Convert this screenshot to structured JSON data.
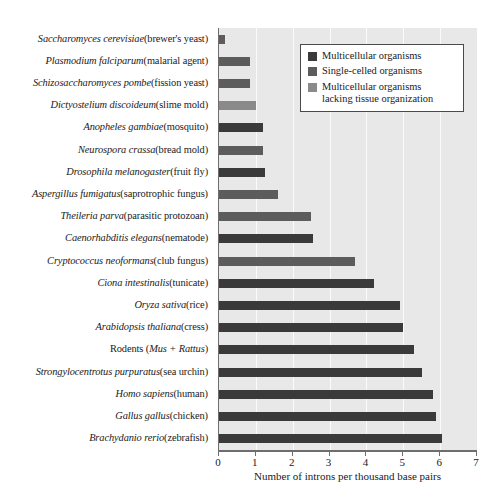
{
  "chart_data": {
    "type": "bar",
    "orientation": "horizontal",
    "title": "",
    "xlabel": "Number of introns per thousand base pairs",
    "ylabel": "",
    "xlim": [
      0,
      7
    ],
    "xticks": [
      0,
      1,
      2,
      3,
      4,
      5,
      6,
      7
    ],
    "xtick_labels": [
      "0",
      "1",
      "2",
      "3",
      "4",
      "5",
      "6",
      "7"
    ],
    "grid": true,
    "grid_axis": "x",
    "legend_position": "top-right",
    "categories": [
      "Saccharomyces cerevisiae (brewer's yeast)",
      "Plasmodium falciparum (malarial agent)",
      "Schizosaccharomyces pombe (fission yeast)",
      "Dictyostelium discoideum (slime mold)",
      "Anopheles gambiae (mosquito)",
      "Neurospora crassa (bread mold)",
      "Drosophila melanogaster (fruit fly)",
      "Aspergillus fumigatus (saprotrophic fungus)",
      "Theileria parva (parasitic protozoan)",
      "Caenorhabditis elegans (nematode)",
      "Cryptococcus neoformans (club fungus)",
      "Ciona intestinalis (tunicate)",
      "Oryza sativa (rice)",
      "Arabidopsis thaliana (cress)",
      "Rodents (Mus + Rattus)",
      "Strongylocentrotus purpuratus (sea urchin)",
      "Homo sapiens (human)",
      "Gallus gallus (chicken)",
      "Brachydanio rerio (zebrafish)"
    ],
    "values": [
      0.15,
      0.85,
      0.85,
      1.0,
      1.2,
      1.2,
      1.25,
      1.6,
      2.5,
      2.55,
      3.7,
      4.2,
      4.9,
      5.0,
      5.3,
      5.5,
      5.8,
      5.9,
      6.05
    ],
    "groups": [
      "single-celled",
      "single-celled",
      "single-celled",
      "lacking-tissue",
      "multicellular",
      "single-celled",
      "multicellular",
      "single-celled",
      "single-celled",
      "multicellular",
      "single-celled",
      "multicellular",
      "multicellular",
      "multicellular",
      "multicellular",
      "multicellular",
      "multicellular",
      "multicellular",
      "multicellular"
    ],
    "series": [
      {
        "name": "Multicellular organisms",
        "key": "multicellular",
        "color": "#3a3a3a"
      },
      {
        "name": "Single-celled organisms",
        "key": "single-celled",
        "color": "#5c5c5c"
      },
      {
        "name": "Multicellular organisms lacking tissue organization",
        "key": "lacking-tissue",
        "color": "#8a8a8a"
      }
    ]
  },
  "labels": [
    {
      "sci": "Saccharomyces cerevisiae",
      "com": " (brewer's yeast)"
    },
    {
      "sci": "Plasmodium falciparum",
      "com": " (malarial agent)"
    },
    {
      "sci": "Schizosaccharomyces pombe",
      "com": " (fission yeast)"
    },
    {
      "sci": "Dictyostelium discoideum",
      "com": " (slime mold)"
    },
    {
      "sci": "Anopheles gambiae",
      "com": " (mosquito)"
    },
    {
      "sci": "Neurospora crassa",
      "com": " (bread mold)"
    },
    {
      "sci": "Drosophila melanogaster",
      "com": " (fruit fly)"
    },
    {
      "sci": "Aspergillus fumigatus",
      "com": " (saprotrophic fungus)"
    },
    {
      "sci": "Theileria parva",
      "com": " (parasitic protozoan)"
    },
    {
      "sci": "Caenorhabditis elegans",
      "com": " (nematode)"
    },
    {
      "sci": "Cryptococcus neoformans",
      "com": " (club fungus)"
    },
    {
      "sci": "Ciona intestinalis",
      "com": " (tunicate)"
    },
    {
      "sci": "Oryza sativa",
      "com": " (rice)"
    },
    {
      "sci": "Arabidopsis thaliana",
      "com": " (cress)"
    },
    {
      "sci": "",
      "com": "Rodents (",
      "sci2": "Mus + Rattus",
      "com2": ")"
    },
    {
      "sci": "Strongylocentrotus purpuratus",
      "com": " (sea urchin)"
    },
    {
      "sci": "Homo sapiens",
      "com": " (human)"
    },
    {
      "sci": "Gallus gallus",
      "com": " (chicken)"
    },
    {
      "sci": "Brachydanio rerio",
      "com": " (zebrafish)"
    }
  ],
  "legend": {
    "items": [
      {
        "label": "Multicellular organisms",
        "color": "#3a3a3a"
      },
      {
        "label": "Single-celled organisms",
        "color": "#5c5c5c"
      },
      {
        "label": "Multicellular organisms\nlacking tissue organization",
        "color": "#8a8a8a"
      }
    ]
  },
  "axis": {
    "xlabel": "Number of introns per thousand base pairs"
  },
  "colors": {
    "plot_background": "#e8e8e8",
    "gridline": "#fbfbfb",
    "axis": "#6e6e6e",
    "text": "#1a1a1a"
  }
}
